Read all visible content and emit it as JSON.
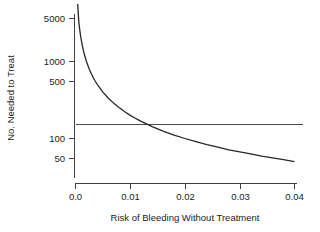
{
  "chart_data": {
    "type": "line",
    "title": "",
    "xlabel": "Risk of Bleeding Without Treatment",
    "ylabel": "No. Needed to Treat",
    "xlim": [
      0.0,
      0.0415
    ],
    "ylim": [
      40,
      6000
    ],
    "yscale": "log",
    "xscale": "linear",
    "grid": false,
    "legend": null,
    "xticks": [
      0.0,
      0.01,
      0.02,
      0.03,
      0.04
    ],
    "xticklabels": [
      "0.0",
      "0.01",
      "0.02",
      "0.03",
      "0.04"
    ],
    "yticks": [
      50,
      100,
      500,
      1000,
      5000
    ],
    "yticklabels": [
      "50",
      "100",
      "500",
      "1000",
      "5000"
    ],
    "series": [
      {
        "name": "Number needed to treat curve",
        "type": "line",
        "x": [
          0.0004,
          0.0006,
          0.0008,
          0.001,
          0.0013,
          0.0016,
          0.002,
          0.0025,
          0.003,
          0.0035,
          0.004,
          0.005,
          0.006,
          0.007,
          0.008,
          0.009,
          0.01,
          0.011,
          0.0113,
          0.012,
          0.014,
          0.016,
          0.018,
          0.02,
          0.022,
          0.024,
          0.026,
          0.028,
          0.03,
          0.032,
          0.034,
          0.036,
          0.038,
          0.04
        ],
        "y": [
          5600,
          3300,
          2500,
          2000,
          1540,
          1250,
          1000,
          800,
          667,
          571,
          500,
          400,
          333,
          286,
          250,
          222,
          200,
          182,
          177,
          167,
          143,
          125,
          111,
          100,
          91,
          83,
          77,
          71,
          67,
          63,
          59,
          56,
          53,
          50
        ]
      },
      {
        "name": "Threshold line",
        "type": "hline",
        "y": 152,
        "x_start": 0.0,
        "x_end": 0.0415
      }
    ],
    "annotations": [
      {
        "text": "Curves intersect",
        "x": 0.0113,
        "y": 152,
        "visible": false
      }
    ]
  },
  "figure": {
    "background_color": "#ffffff",
    "axis_color": "#404040",
    "curve_color": "#262626",
    "hline_color": "#4a4a4a",
    "text_color": "#1a1a1a"
  }
}
